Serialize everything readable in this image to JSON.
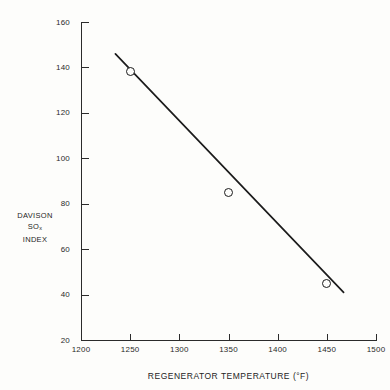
{
  "chart_data": {
    "type": "line",
    "title": "",
    "xlabel": "REGENERATOR TEMPERATURE (°F)",
    "ylabel_lines": [
      "DAVISON",
      "SO",
      "INDEX"
    ],
    "ylabel_subscript": "x",
    "ylabel_full": "DAVISON SOx INDEX",
    "x": [
      1250,
      1350,
      1450
    ],
    "values": [
      138,
      85,
      45
    ],
    "series": [
      {
        "name": "Davison SOx Index vs Regenerator Temperature",
        "x": [
          1250,
          1350,
          1450
        ],
        "values": [
          138,
          85,
          45
        ]
      }
    ],
    "line_extends_to": {
      "x_start": 1235,
      "y_start": 146,
      "x_end": 1467,
      "y_end": 41
    },
    "xlim": [
      1200,
      1500
    ],
    "ylim": [
      20,
      160
    ],
    "xticks": [
      1200,
      1250,
      1300,
      1350,
      1400,
      1450,
      1500
    ],
    "yticks": [
      20,
      40,
      60,
      80,
      100,
      120,
      140,
      160
    ],
    "xtick_labels": [
      "1200",
      "1250",
      "1300",
      "1350",
      "1400",
      "1450",
      "1500"
    ],
    "ytick_labels": [
      "20",
      "40",
      "60",
      "80",
      "100",
      "120",
      "140",
      "160"
    ],
    "grid": false,
    "legend": null,
    "marker_style": "open-circle",
    "colors": {
      "line": "#1b1b1b",
      "axis": "#2b2b2b",
      "text": "#242424",
      "background": "#fdfdfb"
    }
  }
}
